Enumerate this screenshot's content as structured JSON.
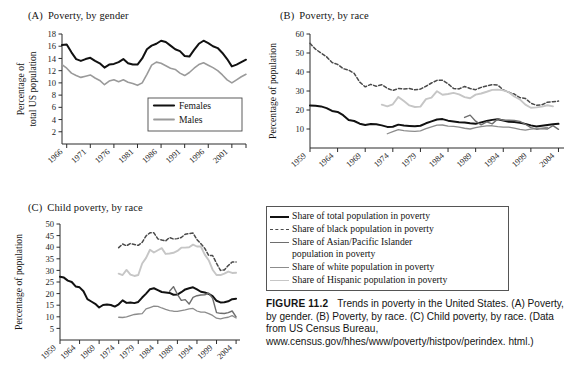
{
  "figure": {
    "number_label": "FIGURE 11.2",
    "caption_lines": [
      "Trends in poverty in the United States.",
      "(A) Poverty, by gender. (B) Poverty, by race. (C) Child",
      "poverty, by race. (Data from US Census Bureau,",
      "www.census.gov/hhes/www/poverty/histpov/perindex.",
      "html.)"
    ]
  },
  "colors": {
    "total": "#111111",
    "black_pop": "#3d3d3d",
    "asian": "#6e6e6e",
    "white": "#8c8c8c",
    "hispanic": "#c2c2c2",
    "females": "#111111",
    "males": "#9a9a9a",
    "axis": "#2b2b2b"
  },
  "shared_legend": {
    "items": [
      {
        "label": "Share of total population in poverty",
        "style": "solid-thick",
        "color": "#111111",
        "icon": "line-swatch-icon"
      },
      {
        "label": "Share of black population in poverty",
        "style": "dashed",
        "color": "#4a4a4a",
        "icon": "dashed-line-swatch-icon"
      },
      {
        "label": "Share of Asian/Pacific Islander\npopulation in poverty",
        "style": "solid",
        "color": "#6e6e6e",
        "icon": "line-swatch-icon"
      },
      {
        "label": "Share of white population in poverty",
        "style": "solid",
        "color": "#8c8c8c",
        "icon": "line-swatch-icon"
      },
      {
        "label": "Share of Hispanic population in poverty",
        "style": "solid",
        "color": "#c6c6c6",
        "icon": "line-swatch-icon"
      }
    ]
  },
  "chart_data": [
    {
      "id": "panel-a",
      "panel_label": "(A)",
      "type": "line",
      "title": "Poverty, by gender",
      "xlabel": "",
      "ylabel": "Percentage of\ntotal US population",
      "ylabel_lines": [
        "Percentage of",
        "total US population"
      ],
      "xlim": [
        1965,
        2004
      ],
      "ylim": [
        0,
        18
      ],
      "yticks": [
        2,
        4,
        6,
        8,
        10,
        12,
        14,
        16,
        18
      ],
      "xticks": [
        1966,
        1971,
        1976,
        1981,
        1986,
        1991,
        1996,
        2001
      ],
      "grid": false,
      "legend_position": "inside-bottom-right",
      "legend": [
        "Females",
        "Males"
      ],
      "x": [
        1965,
        1966,
        1967,
        1968,
        1969,
        1970,
        1971,
        1972,
        1973,
        1974,
        1975,
        1976,
        1977,
        1978,
        1979,
        1980,
        1981,
        1982,
        1983,
        1984,
        1985,
        1986,
        1987,
        1988,
        1989,
        1990,
        1991,
        1992,
        1993,
        1994,
        1995,
        1996,
        1997,
        1998,
        1999,
        2000,
        2001,
        2002,
        2003,
        2004
      ],
      "series": [
        {
          "name": "Females",
          "color": "#111111",
          "style": "solid-thick",
          "width": 2.0,
          "values": [
            16.2,
            16.3,
            15.0,
            13.9,
            13.6,
            13.9,
            14.1,
            13.6,
            13.2,
            12.5,
            13.0,
            13.1,
            13.4,
            13.9,
            13.2,
            13.0,
            13.0,
            14.0,
            15.5,
            16.1,
            16.4,
            16.9,
            16.7,
            16.1,
            15.5,
            15.2,
            14.4,
            14.3,
            15.4,
            16.4,
            16.9,
            16.5,
            16.0,
            15.7,
            14.9,
            13.9,
            12.7,
            13.0,
            13.4,
            13.8
          ]
        },
        {
          "name": "Males",
          "color": "#9a9a9a",
          "style": "solid",
          "width": 1.6,
          "values": [
            13.0,
            12.4,
            11.6,
            11.2,
            10.9,
            11.1,
            11.3,
            10.8,
            10.4,
            9.7,
            10.3,
            10.5,
            10.2,
            10.5,
            10.1,
            9.9,
            9.6,
            10.0,
            11.4,
            12.9,
            13.4,
            13.2,
            12.8,
            12.4,
            12.2,
            11.6,
            11.2,
            11.7,
            12.4,
            13.0,
            13.3,
            12.9,
            12.5,
            12.0,
            11.3,
            10.5,
            10.0,
            10.5,
            11.0,
            11.4
          ]
        }
      ]
    },
    {
      "id": "panel-b",
      "panel_label": "(B)",
      "type": "line",
      "title": "Poverty, by race",
      "xlabel": "",
      "ylabel": "Percentage of population",
      "ylim": [
        0,
        60
      ],
      "yticks": [
        10,
        20,
        30,
        40,
        50,
        60
      ],
      "xticks": [
        1959,
        1964,
        1969,
        1974,
        1979,
        1984,
        1989,
        1994,
        1999,
        2004
      ],
      "xlim": [
        1959,
        2005
      ],
      "grid": false,
      "series": [
        {
          "name": "Share of total population in poverty",
          "color": "#111111",
          "style": "solid-thick",
          "width": 2.0,
          "x_start": 1959,
          "values": [
            22.4,
            22.2,
            21.9,
            21.0,
            19.5,
            19.0,
            17.3,
            14.7,
            14.2,
            12.8,
            12.1,
            12.6,
            12.5,
            11.9,
            11.1,
            11.2,
            12.3,
            11.8,
            11.6,
            11.4,
            11.7,
            13.0,
            14.0,
            15.0,
            15.2,
            14.4,
            14.0,
            13.6,
            13.4,
            13.0,
            12.8,
            13.5,
            14.2,
            14.8,
            15.1,
            14.5,
            13.8,
            13.7,
            13.3,
            12.7,
            11.9,
            11.3,
            11.7,
            12.1,
            12.5,
            12.7
          ]
        },
        {
          "name": "Share of black population in poverty",
          "color": "#4a4a4a",
          "style": "dashed",
          "width": 1.5,
          "x_start": 1959,
          "values": [
            55.1,
            52.0,
            50.0,
            48.0,
            45.0,
            44.0,
            41.8,
            41.0,
            39.3,
            34.7,
            32.2,
            33.5,
            32.5,
            33.3,
            31.4,
            30.3,
            31.3,
            31.1,
            31.3,
            30.6,
            31.0,
            32.5,
            34.2,
            35.6,
            35.7,
            33.8,
            31.3,
            31.1,
            32.4,
            31.3,
            30.7,
            31.9,
            32.7,
            33.4,
            33.1,
            30.6,
            29.3,
            28.4,
            26.5,
            26.1,
            23.6,
            22.5,
            22.7,
            24.1,
            24.4,
            24.7
          ]
        },
        {
          "name": "Share of Asian/Pacific Islander population in poverty",
          "color": "#6e6e6e",
          "style": "solid",
          "width": 1.4,
          "x_start": 1987,
          "values": [
            16.1,
            17.3,
            14.1,
            12.2,
            13.8,
            12.7,
            15.3,
            14.6,
            14.6,
            14.5,
            14.0,
            12.5,
            10.7,
            9.9,
            10.2,
            10.0,
            11.8,
            9.8
          ]
        },
        {
          "name": "Share of white population in poverty",
          "color": "#8c8c8c",
          "style": "solid",
          "width": 1.3,
          "x_start": 1973,
          "values": [
            7.5,
            8.6,
            9.7,
            9.1,
            8.9,
            8.7,
            9.0,
            10.2,
            11.1,
            12.0,
            12.1,
            11.5,
            11.4,
            11.0,
            10.4,
            10.0,
            10.7,
            11.3,
            11.6,
            11.7,
            11.2,
            11.0,
            11.0,
            10.5,
            9.8,
            9.4,
            9.9,
            10.2,
            10.5,
            10.8
          ]
        },
        {
          "name": "Share of Hispanic population in poverty",
          "color": "#c6c6c6",
          "style": "solid",
          "width": 1.9,
          "x_start": 1972,
          "values": [
            22.8,
            21.9,
            23.0,
            26.9,
            24.7,
            22.4,
            21.6,
            21.8,
            25.7,
            26.5,
            29.9,
            28.0,
            28.4,
            29.0,
            28.2,
            26.8,
            26.2,
            28.1,
            28.7,
            29.6,
            30.6,
            30.7,
            30.3,
            29.4,
            27.1,
            25.6,
            22.8,
            21.2,
            21.4,
            21.8,
            22.5,
            21.9
          ]
        }
      ]
    },
    {
      "id": "panel-c",
      "panel_label": "(C)",
      "type": "line",
      "title": "Child poverty, by race",
      "xlabel": "",
      "ylabel": "Percentage of population",
      "ylim": [
        0,
        50
      ],
      "yticks": [
        5,
        10,
        15,
        20,
        25,
        30,
        35,
        40,
        45,
        50
      ],
      "xticks": [
        1959,
        1964,
        1969,
        1974,
        1979,
        1984,
        1989,
        1994,
        1999,
        2004
      ],
      "xlim": [
        1959,
        2005
      ],
      "grid": false,
      "series": [
        {
          "name": "Share of total population in poverty",
          "color": "#111111",
          "style": "solid-thick",
          "width": 2.0,
          "x_start": 1959,
          "values": [
            27.3,
            26.9,
            25.6,
            25.0,
            23.1,
            22.7,
            21.0,
            17.6,
            16.6,
            15.6,
            14.0,
            15.1,
            15.3,
            15.1,
            14.4,
            15.4,
            17.1,
            16.0,
            16.2,
            15.9,
            16.4,
            18.3,
            20.0,
            21.9,
            22.3,
            21.5,
            20.7,
            20.5,
            20.3,
            19.5,
            19.6,
            20.6,
            21.8,
            22.3,
            22.7,
            21.8,
            20.8,
            20.5,
            19.9,
            18.9,
            16.9,
            16.2,
            16.3,
            16.7,
            17.6,
            17.8
          ]
        },
        {
          "name": "Share of black population in poverty",
          "color": "#4a4a4a",
          "style": "dashed",
          "width": 1.5,
          "x_start": 1974,
          "values": [
            39.8,
            41.4,
            40.6,
            41.6,
            41.2,
            40.8,
            42.1,
            44.9,
            46.2,
            46.2,
            43.6,
            43.1,
            42.7,
            44.2,
            43.5,
            43.7,
            44.2,
            45.6,
            45.9,
            46.1,
            43.3,
            41.5,
            39.5,
            36.4,
            36.4,
            33.1,
            30.0,
            30.2,
            32.1,
            33.6,
            33.6
          ]
        },
        {
          "name": "Share of Asian/Pacific Islander population in poverty",
          "color": "#6e6e6e",
          "style": "solid",
          "width": 1.4,
          "x_start": 1987,
          "values": [
            21.0,
            23.0,
            19.7,
            17.1,
            17.4,
            15.5,
            18.4,
            19.1,
            19.4,
            19.5,
            20.2,
            18.0,
            11.8,
            11.5,
            11.4,
            11.8,
            12.5,
            10.0
          ]
        },
        {
          "name": "Share of white population in poverty",
          "color": "#8c8c8c",
          "style": "solid",
          "width": 1.3,
          "x_start": 1974,
          "values": [
            9.8,
            9.7,
            10.0,
            10.5,
            11.0,
            11.2,
            11.4,
            13.4,
            14.0,
            14.6,
            14.5,
            13.8,
            13.2,
            12.7,
            12.4,
            12.3,
            12.7,
            13.0,
            13.4,
            13.6,
            12.5,
            12.0,
            12.0,
            11.4,
            10.6,
            9.4,
            9.1,
            9.5,
            9.8,
            10.5,
            9.5
          ]
        },
        {
          "name": "Share of Hispanic population in poverty",
          "color": "#c6c6c6",
          "style": "solid",
          "width": 1.9,
          "x_start": 1974,
          "values": [
            28.6,
            28.0,
            30.2,
            28.2,
            27.6,
            28.0,
            33.0,
            35.4,
            38.9,
            37.7,
            38.7,
            39.6,
            37.1,
            37.3,
            37.6,
            38.4,
            39.8,
            39.8,
            40.0,
            41.1,
            40.3,
            40.3,
            36.8,
            34.4,
            30.3,
            28.0,
            28.0,
            28.6,
            29.5,
            28.9,
            29.0
          ]
        }
      ]
    }
  ]
}
